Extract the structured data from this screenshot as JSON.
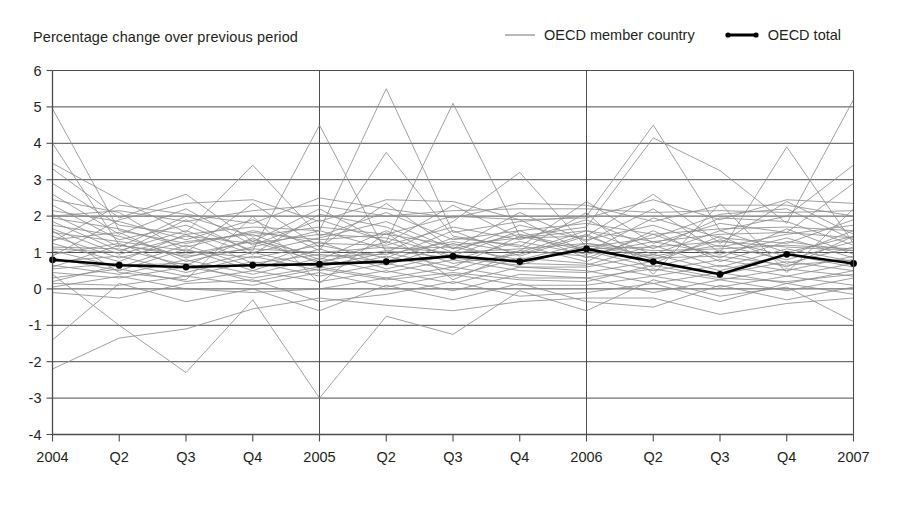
{
  "subtitle": "Percentage change over previous period",
  "legend": {
    "items": [
      {
        "label": "OECD member country",
        "style": "thin-gray-line",
        "color": "#8c8c8c"
      },
      {
        "label": "OECD total",
        "style": "thick-black-line-with-dots",
        "color": "#000000"
      }
    ]
  },
  "colors": {
    "member_line": "#8c8c8c",
    "total_line": "#000000",
    "gridline": "#4d4d4d",
    "axis": "#4d4d4d",
    "background": "#ffffff",
    "text": "#231f20"
  },
  "chart_data": {
    "type": "line",
    "title": "",
    "subtitle": "Percentage change over previous period",
    "xlabel": "",
    "ylabel": "",
    "ylim": [
      -4,
      6
    ],
    "y_ticks": [
      -4,
      -3,
      -2,
      -1,
      0,
      1,
      2,
      3,
      4,
      5,
      6
    ],
    "y_tick_labels": [
      "-4",
      "-3",
      "-2",
      "-1",
      "0",
      "1",
      "2",
      "3",
      "4",
      "5",
      "6"
    ],
    "grid": true,
    "grid_axis": "y",
    "legend_position": "top-right",
    "x": [
      "2004",
      "Q2",
      "Q3",
      "Q4",
      "2005",
      "Q2",
      "Q3",
      "Q4",
      "2006",
      "Q2",
      "Q3",
      "Q4",
      "2007"
    ],
    "year_dividers": [
      "2005",
      "2006"
    ],
    "highlight_series": {
      "name": "OECD total",
      "marker": "circle",
      "values": [
        0.8,
        0.65,
        0.6,
        0.65,
        0.68,
        0.75,
        0.9,
        0.75,
        1.1,
        0.75,
        0.4,
        0.95,
        0.7
      ]
    },
    "series": [
      {
        "name": "OECD member country",
        "values": [
          4.95,
          1.6,
          1.25,
          1.55,
          1.35,
          1.5,
          1.2,
          1.4,
          1.6,
          1.3,
          1.5,
          1.55,
          1.4
        ]
      },
      {
        "name": "OECD member country",
        "values": [
          4.0,
          1.2,
          0.9,
          1.1,
          1.0,
          1.15,
          1.0,
          1.1,
          1.25,
          1.05,
          1.1,
          1.2,
          1.1
        ]
      },
      {
        "name": "OECD member country",
        "values": [
          3.45,
          2.45,
          1.55,
          3.4,
          1.45,
          2.1,
          1.35,
          1.6,
          1.8,
          1.5,
          1.65,
          1.7,
          1.6
        ]
      },
      {
        "name": "OECD member country",
        "values": [
          3.3,
          1.95,
          2.6,
          1.3,
          2.2,
          1.25,
          2.3,
          1.4,
          1.45,
          2.6,
          1.25,
          2.4,
          1.5
        ]
      },
      {
        "name": "OECD member country",
        "values": [
          2.9,
          1.75,
          1.5,
          1.7,
          1.6,
          5.5,
          1.55,
          1.85,
          2.0,
          4.5,
          1.6,
          2.0,
          3.4
        ]
      },
      {
        "name": "OECD member country",
        "values": [
          2.6,
          1.5,
          2.2,
          1.2,
          1.9,
          1.3,
          5.1,
          1.45,
          1.7,
          4.15,
          3.25,
          1.8,
          5.2
        ]
      },
      {
        "name": "OECD member country",
        "values": [
          2.45,
          2.1,
          1.0,
          2.35,
          1.15,
          2.35,
          1.1,
          2.1,
          1.3,
          2.2,
          1.0,
          3.9,
          1.25
        ]
      },
      {
        "name": "OECD member country",
        "values": [
          2.3,
          1.35,
          1.75,
          1.05,
          4.5,
          1.0,
          1.85,
          3.2,
          1.15,
          1.4,
          2.05,
          2.2,
          1.35
        ]
      },
      {
        "name": "OECD member country",
        "values": [
          2.15,
          1.85,
          1.35,
          1.9,
          1.05,
          3.75,
          1.45,
          1.15,
          2.4,
          1.25,
          1.8,
          1.55,
          2.9
        ]
      },
      {
        "name": "OECD member country",
        "values": [
          2.05,
          1.15,
          2.0,
          1.45,
          1.7,
          1.5,
          2.0,
          1.9,
          1.0,
          1.95,
          1.4,
          1.25,
          1.9
        ]
      },
      {
        "name": "OECD member country",
        "values": [
          1.95,
          1.65,
          1.15,
          1.6,
          1.25,
          1.2,
          1.7,
          1.35,
          1.9,
          1.1,
          1.95,
          1.85,
          1.2
        ]
      },
      {
        "name": "OECD member country",
        "values": [
          1.85,
          1.05,
          1.6,
          0.95,
          2.05,
          1.7,
          1.0,
          1.75,
          1.35,
          1.75,
          1.15,
          1.5,
          1.75
        ]
      },
      {
        "name": "OECD member country",
        "values": [
          1.75,
          1.45,
          0.85,
          1.35,
          0.9,
          0.95,
          1.3,
          1.0,
          1.6,
          0.95,
          1.6,
          1.0,
          1.45
        ]
      },
      {
        "name": "OECD member country",
        "values": [
          1.65,
          0.95,
          1.45,
          1.25,
          1.5,
          1.4,
          0.9,
          1.6,
          0.85,
          1.5,
          0.85,
          1.65,
          0.95
        ]
      },
      {
        "name": "OECD member country",
        "values": [
          1.55,
          1.3,
          1.05,
          0.85,
          1.2,
          0.85,
          1.6,
          0.9,
          1.45,
          0.8,
          1.35,
          0.9,
          1.6
        ]
      },
      {
        "name": "OECD member country",
        "values": [
          1.45,
          0.85,
          1.3,
          1.5,
          0.8,
          1.6,
          0.8,
          1.3,
          0.95,
          1.3,
          0.95,
          1.4,
          0.85
        ]
      },
      {
        "name": "OECD member country",
        "values": [
          1.35,
          1.55,
          0.75,
          1.15,
          1.6,
          1.1,
          1.15,
          0.8,
          1.25,
          0.9,
          1.2,
          0.8,
          1.3
        ]
      },
      {
        "name": "OECD member country",
        "values": [
          1.25,
          0.75,
          1.5,
          0.7,
          0.95,
          0.75,
          1.4,
          1.2,
          0.75,
          1.6,
          0.75,
          1.3,
          1.05
        ]
      },
      {
        "name": "OECD member country",
        "values": [
          1.15,
          1.1,
          0.65,
          1.4,
          0.7,
          1.3,
          0.7,
          0.95,
          1.5,
          0.7,
          1.45,
          0.7,
          1.15
        ]
      },
      {
        "name": "OECD member country",
        "values": [
          1.05,
          0.6,
          1.2,
          0.6,
          1.3,
          0.65,
          1.25,
          0.7,
          0.65,
          1.2,
          0.6,
          1.1,
          0.75
        ]
      },
      {
        "name": "OECD member country",
        "values": [
          0.95,
          1.25,
          0.55,
          1.0,
          0.6,
          1.0,
          0.6,
          1.45,
          1.05,
          0.6,
          1.05,
          0.6,
          1.45
        ]
      },
      {
        "name": "OECD member country",
        "values": [
          0.85,
          0.5,
          1.1,
          0.5,
          1.1,
          0.55,
          0.95,
          0.6,
          0.6,
          0.95,
          0.5,
          0.95,
          0.6
        ]
      },
      {
        "name": "OECD member country",
        "values": [
          0.75,
          0.9,
          0.45,
          0.9,
          0.5,
          0.9,
          0.5,
          1.05,
          0.9,
          0.5,
          0.8,
          0.5,
          0.9
        ]
      },
      {
        "name": "OECD member country",
        "values": [
          0.65,
          0.4,
          0.8,
          0.4,
          0.85,
          0.45,
          0.8,
          0.5,
          0.45,
          0.75,
          0.4,
          0.75,
          0.5
        ]
      },
      {
        "name": "OECD member country",
        "values": [
          0.55,
          0.7,
          0.35,
          0.75,
          0.35,
          0.7,
          0.35,
          0.85,
          0.7,
          0.35,
          0.65,
          0.35,
          0.7
        ]
      },
      {
        "name": "OECD member country",
        "values": [
          0.45,
          0.3,
          0.6,
          0.3,
          0.6,
          0.3,
          0.6,
          0.3,
          0.3,
          0.55,
          0.25,
          0.55,
          0.35
        ]
      },
      {
        "name": "OECD member country",
        "values": [
          0.3,
          0.55,
          0.2,
          0.5,
          0.2,
          0.5,
          0.15,
          0.6,
          0.5,
          0.15,
          0.45,
          0.15,
          0.5
        ]
      },
      {
        "name": "OECD member country",
        "values": [
          0.15,
          0.1,
          0.35,
          0.1,
          0.45,
          0.05,
          0.4,
          0.1,
          0.1,
          0.35,
          0.05,
          0.35,
          0.1
        ]
      },
      {
        "name": "OECD member country",
        "values": [
          0.05,
          0.35,
          0.0,
          -0.1,
          0.0,
          0.3,
          -0.05,
          0.4,
          0.3,
          -0.1,
          0.25,
          -0.05,
          0.3
        ]
      },
      {
        "name": "OECD member country",
        "values": [
          -0.1,
          -0.25,
          0.15,
          0.25,
          -0.35,
          -0.15,
          0.2,
          -0.2,
          -0.1,
          0.15,
          -0.35,
          0.15,
          -0.15
        ]
      },
      {
        "name": "OECD member country",
        "values": [
          -1.4,
          0.15,
          -0.35,
          0.0,
          -0.6,
          0.1,
          -0.3,
          0.15,
          -0.35,
          -0.5,
          0.1,
          -0.3,
          0.05
        ]
      },
      {
        "name": "OECD member country",
        "values": [
          -2.2,
          -1.35,
          -1.1,
          -0.55,
          -0.25,
          -0.45,
          -0.6,
          -0.35,
          -0.25,
          -0.25,
          -0.7,
          -0.4,
          -0.25
        ]
      },
      {
        "name": "OECD member country",
        "values": [
          0.4,
          -1.0,
          -2.3,
          -0.3,
          -3.0,
          -0.75,
          -1.25,
          -0.05,
          -0.6,
          0.25,
          -0.2,
          0.05,
          -0.9
        ]
      },
      {
        "name": "OECD member country",
        "values": [
          1.6,
          0.45,
          0.25,
          2.0,
          0.15,
          1.55,
          0.25,
          1.05,
          2.1,
          0.4,
          2.35,
          0.45,
          2.2
        ]
      },
      {
        "name": "OECD member country",
        "values": [
          2.0,
          2.15,
          1.85,
          2.15,
          2.3,
          2.0,
          2.15,
          2.2,
          2.2,
          2.1,
          2.15,
          2.1,
          2.15
        ]
      },
      {
        "name": "OECD member country",
        "values": [
          1.3,
          2.3,
          2.05,
          1.8,
          2.5,
          2.2,
          1.95,
          2.35,
          2.3,
          1.85,
          2.3,
          2.3,
          2.0
        ]
      },
      {
        "name": "OECD member country",
        "values": [
          0.9,
          1.9,
          2.35,
          2.45,
          1.85,
          2.45,
          2.4,
          1.9,
          1.95,
          2.45,
          1.9,
          2.45,
          2.35
        ]
      },
      {
        "name": "OECD member country",
        "values": [
          1.1,
          1.0,
          1.9,
          1.0,
          1.4,
          1.85,
          1.1,
          1.5,
          1.1,
          1.15,
          1.3,
          1.15,
          1.05
        ]
      },
      {
        "name": "OECD member country",
        "values": [
          0.6,
          1.2,
          0.95,
          1.3,
          0.75,
          1.05,
          0.85,
          0.65,
          1.2,
          0.85,
          0.9,
          0.65,
          0.8
        ]
      },
      {
        "name": "OECD member country",
        "values": [
          0.2,
          0.65,
          0.7,
          0.2,
          0.55,
          0.25,
          0.45,
          0.25,
          0.2,
          0.65,
          0.3,
          0.2,
          0.4
        ]
      }
    ]
  }
}
